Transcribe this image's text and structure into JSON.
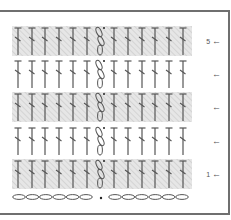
{
  "diagram": {
    "type": "crochet-stitch-chart",
    "colors": {
      "border": "#6f6f6f",
      "stitch": "#555555",
      "shade": "#e4e4e4",
      "hatch": "#d2d2d2"
    },
    "stitch_symbol": "double-crochet",
    "stitches_left": 6,
    "stitches_right": 6,
    "center_column": "chain-3-turning",
    "foundation": {
      "chains_left": 6,
      "chains_right": 6,
      "center": "dot"
    },
    "rows": [
      {
        "number": 5,
        "label": "5",
        "arrow": "←",
        "shaded": true
      },
      {
        "number": 4,
        "label": "",
        "arrow": "←",
        "shaded": false
      },
      {
        "number": 3,
        "label": "",
        "arrow": "←",
        "shaded": true
      },
      {
        "number": 2,
        "label": "",
        "arrow": "←",
        "shaded": false
      },
      {
        "number": 1,
        "label": "1",
        "arrow": "←",
        "shaded": true
      }
    ]
  }
}
